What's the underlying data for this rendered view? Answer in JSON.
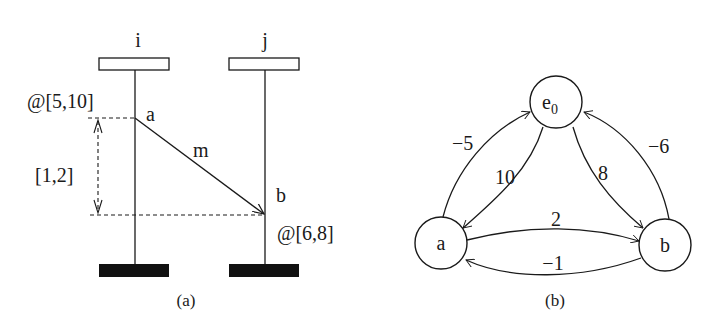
{
  "panel_a": {
    "caption": "(a)",
    "processes": [
      {
        "id": "i",
        "label": "i"
      },
      {
        "id": "j",
        "label": "j"
      }
    ],
    "events": [
      {
        "id": "a",
        "label": "a",
        "process": "i",
        "time_window": "@[5,10]"
      },
      {
        "id": "b",
        "label": "b",
        "process": "j",
        "time_window": "@[6,8]"
      }
    ],
    "message": {
      "label": "m",
      "from": "a",
      "to": "b"
    },
    "delay_interval": "[1,2]"
  },
  "panel_b": {
    "caption": "(b)",
    "nodes": [
      {
        "id": "e0",
        "label": "e",
        "subscript": "0"
      },
      {
        "id": "a",
        "label": "a"
      },
      {
        "id": "b",
        "label": "b"
      }
    ],
    "edges": [
      {
        "from": "a",
        "to": "e0",
        "weight": "−5"
      },
      {
        "from": "e0",
        "to": "a",
        "weight": "10"
      },
      {
        "from": "e0",
        "to": "b",
        "weight": "8"
      },
      {
        "from": "b",
        "to": "e0",
        "weight": "−6"
      },
      {
        "from": "a",
        "to": "b",
        "weight": "2"
      },
      {
        "from": "b",
        "to": "a",
        "weight": "−1"
      }
    ]
  }
}
